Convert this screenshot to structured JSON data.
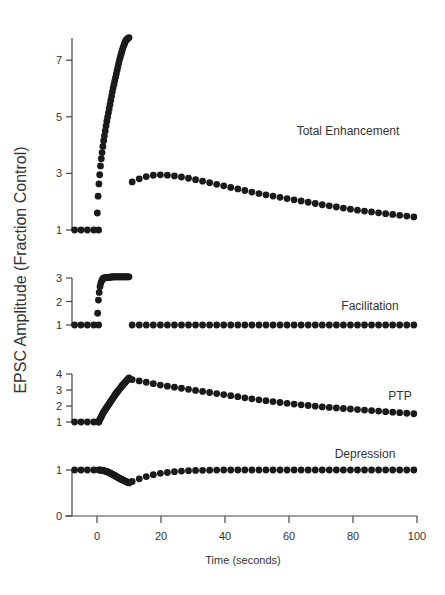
{
  "chart_data": {
    "type": "scatter",
    "ylabel": "EPSC Amplitude (Fraction Control)",
    "xlabel": "Time (seconds)",
    "x_ticks": [
      0,
      20,
      40,
      60,
      80,
      100
    ],
    "xlim": [
      -8,
      100
    ],
    "grid": false,
    "legend": "none (panel labels inline)",
    "panels": [
      {
        "name": "Total Enhancement",
        "label": "Total Enhancement",
        "y_ticks": [
          1,
          3,
          5,
          7
        ],
        "ylim": [
          1,
          7.8
        ],
        "segments": [
          {
            "t": [
              -7,
              -5,
              -3,
              -1,
              0.5
            ],
            "v": [
              1,
              1,
              1,
              1,
              1
            ]
          },
          {
            "burst": true,
            "t_start": 0.1,
            "t_end": 10,
            "v_start": 1.6,
            "v_end": 7.8,
            "sample_points": [
              [
                0.1,
                1.6
              ],
              [
                0.3,
                2.1
              ],
              [
                0.5,
                2.5
              ],
              [
                0.8,
                2.9
              ],
              [
                1.2,
                3.4
              ],
              [
                2,
                4.1
              ],
              [
                3,
                4.8
              ],
              [
                4,
                5.4
              ],
              [
                5,
                6.0
              ],
              [
                6,
                6.5
              ],
              [
                7,
                7.0
              ],
              [
                8,
                7.4
              ],
              [
                9,
                7.7
              ],
              [
                10,
                7.8
              ]
            ]
          },
          {
            "t": [
              11,
              14,
              17,
              20,
              23,
              26,
              30,
              40,
              50,
              60,
              70,
              80,
              90,
              100
            ],
            "v": [
              2.7,
              2.85,
              2.93,
              2.95,
              2.93,
              2.88,
              2.8,
              2.55,
              2.3,
              2.1,
              1.9,
              1.72,
              1.58,
              1.45
            ]
          }
        ]
      },
      {
        "name": "Facilitation",
        "label": "Facilitation",
        "y_ticks": [
          1,
          2,
          3
        ],
        "ylim": [
          1,
          3
        ],
        "segments": [
          {
            "t": [
              -7,
              -5,
              -3,
              -1,
              0.5
            ],
            "v": [
              1,
              1,
              1,
              1,
              1
            ]
          },
          {
            "burst": true,
            "sample_points": [
              [
                0.2,
                1.5
              ],
              [
                0.4,
                2.0
              ],
              [
                0.7,
                2.4
              ],
              [
                1,
                2.7
              ],
              [
                1.5,
                2.9
              ],
              [
                2,
                3.0
              ],
              [
                5,
                3.05
              ],
              [
                10,
                3.05
              ]
            ]
          },
          {
            "t": [
              11,
              20,
              40,
              60,
              80,
              100
            ],
            "v": [
              1,
              1,
              1,
              1,
              1,
              1
            ]
          }
        ]
      },
      {
        "name": "PTP",
        "label": "PTP",
        "y_ticks": [
          1,
          2,
          3,
          4
        ],
        "ylim": [
          1,
          4
        ],
        "segments": [
          {
            "t": [
              -7,
              -5,
              -3,
              -1,
              0.5
            ],
            "v": [
              1,
              1,
              1,
              1,
              1
            ]
          },
          {
            "burst": true,
            "sample_points": [
              [
                0.5,
                1.0
              ],
              [
                2,
                1.6
              ],
              [
                4,
                2.2
              ],
              [
                6,
                2.8
              ],
              [
                8,
                3.3
              ],
              [
                10,
                3.75
              ]
            ]
          },
          {
            "t": [
              11,
              15,
              20,
              30,
              40,
              50,
              60,
              70,
              80,
              90,
              100
            ],
            "v": [
              3.65,
              3.5,
              3.3,
              3.0,
              2.7,
              2.4,
              2.15,
              1.95,
              1.8,
              1.65,
              1.5
            ]
          }
        ]
      },
      {
        "name": "Depression",
        "label": "Depression",
        "y_ticks": [
          0,
          1
        ],
        "ylim": [
          0,
          1.1
        ],
        "segments": [
          {
            "t": [
              -7,
              -5,
              -3,
              -1,
              0.5
            ],
            "v": [
              1,
              1,
              1,
              1,
              1
            ]
          },
          {
            "burst": true,
            "sample_points": [
              [
                1,
                1.0
              ],
              [
                3,
                0.97
              ],
              [
                5,
                0.9
              ],
              [
                7,
                0.82
              ],
              [
                9,
                0.75
              ],
              [
                10,
                0.72
              ]
            ]
          },
          {
            "t": [
              11,
              14,
              17,
              20,
              25,
              30,
              40,
              60,
              80,
              100
            ],
            "v": [
              0.75,
              0.83,
              0.89,
              0.93,
              0.97,
              0.99,
              1.0,
              1.0,
              1.0,
              1.0
            ]
          }
        ]
      }
    ]
  },
  "labels": {
    "ylabel": "EPSC Amplitude (Fraction Control)",
    "xlabel": "Time (seconds)"
  }
}
